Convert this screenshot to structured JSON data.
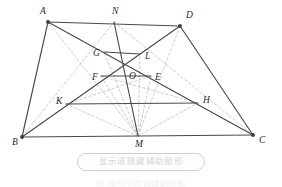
{
  "figure": {
    "type": "geometry-diagram",
    "colors": {
      "solid_stroke": "#4a4a4a",
      "vertex_dot": "#3a3a3a",
      "label_text": "#2b2b2b",
      "dashed_stroke": "#b9c6b6",
      "button_border": "#c9d4cb",
      "button_fill": "#fdfefd",
      "button_text": "#cfd8d0"
    },
    "points": [
      {
        "id": "A",
        "label": "A",
        "x": 48,
        "y": 22,
        "label_x": 40,
        "label_y": 14,
        "dot": true
      },
      {
        "id": "N",
        "label": "N",
        "x": 114,
        "y": 22,
        "label_x": 112,
        "label_y": 14,
        "dot": false
      },
      {
        "id": "D",
        "label": "D",
        "x": 180,
        "y": 26,
        "label_x": 186,
        "label_y": 18,
        "dot": true
      },
      {
        "id": "G",
        "label": "G",
        "x": 104,
        "y": 52,
        "label_x": 93,
        "label_y": 56,
        "dot": false
      },
      {
        "id": "L",
        "label": "L",
        "x": 140,
        "y": 54,
        "label_x": 145,
        "label_y": 59,
        "dot": false
      },
      {
        "id": "O",
        "label": "O",
        "x": 126,
        "y": 71,
        "label_x": 129,
        "label_y": 79,
        "dot": false
      },
      {
        "id": "F",
        "label": "F",
        "x": 101,
        "y": 76,
        "label_x": 92,
        "label_y": 80,
        "dot": false
      },
      {
        "id": "E",
        "label": "E",
        "x": 151,
        "y": 76,
        "label_x": 155,
        "label_y": 80,
        "dot": false
      },
      {
        "id": "K",
        "label": "K",
        "x": 66,
        "y": 104,
        "label_x": 56,
        "label_y": 104,
        "dot": false
      },
      {
        "id": "H",
        "label": "H",
        "x": 198,
        "y": 103,
        "label_x": 203,
        "label_y": 103,
        "dot": false
      },
      {
        "id": "B",
        "label": "B",
        "x": 22,
        "y": 137,
        "label_x": 12,
        "label_y": 145,
        "dot": true
      },
      {
        "id": "M",
        "label": "M",
        "x": 138,
        "y": 136,
        "label_x": 135,
        "label_y": 147,
        "dot": false
      },
      {
        "id": "C",
        "label": "C",
        "x": 253,
        "y": 135,
        "label_x": 259,
        "label_y": 143,
        "dot": true
      }
    ],
    "solid_segments": [
      {
        "name": "side-AB",
        "from": "A",
        "to": "B"
      },
      {
        "name": "side-AD",
        "from": "A",
        "to": "D"
      },
      {
        "name": "side-DC",
        "from": "D",
        "to": "C"
      },
      {
        "name": "side-BC",
        "from": "B",
        "to": "C"
      },
      {
        "name": "diagonal-AC",
        "from": "A",
        "to": "C"
      },
      {
        "name": "diagonal-DB",
        "from": "D",
        "to": "B"
      },
      {
        "name": "segment-NM",
        "from": "N",
        "to": "M"
      },
      {
        "name": "chord-GL",
        "from": "G",
        "to": "L"
      },
      {
        "name": "chord-FE",
        "from": "F",
        "to": "E"
      },
      {
        "name": "chord-KH",
        "from": "K",
        "to": "H"
      }
    ],
    "dashed_segments": [
      {
        "name": "aux-NB",
        "from": "N",
        "to": "B"
      },
      {
        "name": "aux-NC",
        "from": "N",
        "to": "C"
      },
      {
        "name": "aux-MA",
        "from": "M",
        "to": "A"
      },
      {
        "name": "aux-MD",
        "from": "M",
        "to": "D"
      },
      {
        "name": "aux-MF",
        "from": "M",
        "to": "F"
      },
      {
        "name": "aux-ME",
        "from": "M",
        "to": "E"
      },
      {
        "name": "aux-MK",
        "from": "M",
        "to": "K"
      },
      {
        "name": "aux-MH",
        "from": "M",
        "to": "H"
      },
      {
        "name": "aux-MG",
        "from": "M",
        "to": "G"
      },
      {
        "name": "aux-ML",
        "from": "M",
        "to": "L"
      },
      {
        "name": "aux-KE",
        "from": "K",
        "to": "E"
      },
      {
        "name": "aux-FH",
        "from": "F",
        "to": "H"
      }
    ]
  },
  "toggle": {
    "label": "显示或隐藏辅助图形",
    "state": "visible"
  },
  "caption": {
    "text": "图    梯形中位线辅助图形"
  }
}
